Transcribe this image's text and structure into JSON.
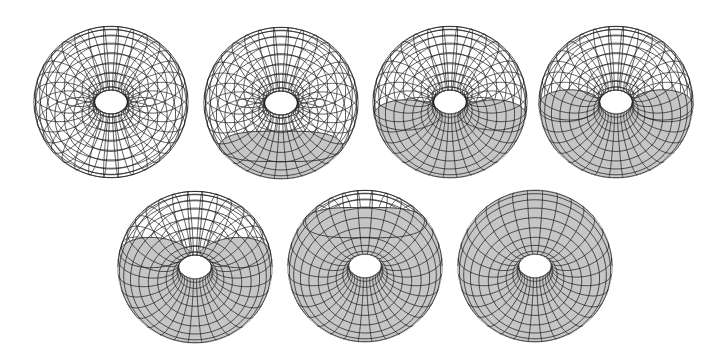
{
  "figure": {
    "line_color": "#1e1e1e",
    "water_color": "#c6c6c6",
    "background": "#ffffff",
    "mesh": {
      "meridians": 32,
      "parallels": 20
    },
    "rows": [
      {
        "panels": [
          {
            "fill_fraction": 0.0
          },
          {
            "fill_fraction": 0.2
          },
          {
            "fill_fraction": 0.41
          },
          {
            "fill_fraction": 0.48
          }
        ]
      },
      {
        "panels": [
          {
            "fill_fraction": 0.6
          },
          {
            "fill_fraction": 0.8
          },
          {
            "fill_fraction": 1.0
          }
        ]
      }
    ]
  }
}
